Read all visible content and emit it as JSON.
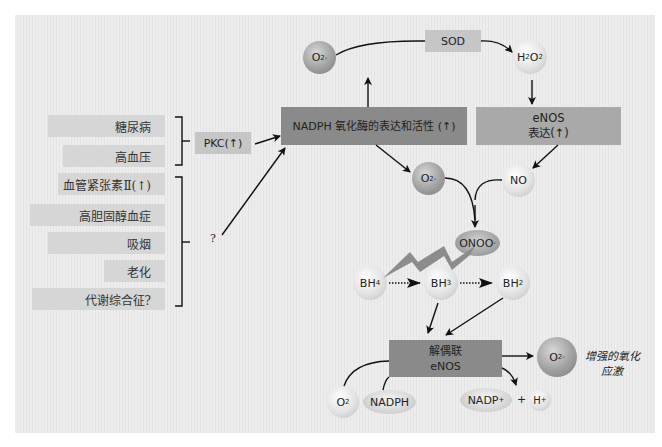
{
  "colors": {
    "panel_bg": "#e9e9e9",
    "label_bg": "#d6d6d6",
    "nadph_box": "#8a8a8a",
    "enos_box": "#a9a9a9",
    "sod_box": "#c6c6c6",
    "arrow": "#111111"
  },
  "risk_factors": {
    "group_pkc": [
      "糖尿病",
      "高血压"
    ],
    "group_unknown": [
      "血管紧张素Ⅱ(↑)",
      "高胆固醇血症",
      "吸烟",
      "老化",
      "代谢综合征?"
    ]
  },
  "pkc": {
    "label": "PKC(↑)"
  },
  "unknown_mediator": {
    "label": "?"
  },
  "nadph_oxidase": {
    "label": "NADPH 氧化酶的表达和活性 (↑)"
  },
  "sod": {
    "label": "SOD"
  },
  "enos_expression": {
    "line1": "eNOS",
    "line2": "表达(↑)"
  },
  "molecules": {
    "superoxide_top": {
      "base": "O",
      "sub": "2",
      "sup": "-"
    },
    "h2o2": {
      "h": "H",
      "s1": "2",
      "o": "O",
      "s2": "2"
    },
    "superoxide_mid": {
      "base": "O",
      "sub": "2",
      "sup": "-"
    },
    "no": "NO",
    "onoo": {
      "base": "ONOO",
      "sup": "-"
    },
    "bh4": {
      "base": "BH",
      "sub": "4"
    },
    "bh3": {
      "base": "BH",
      "sub": "3"
    },
    "bh2": {
      "base": "BH",
      "sub": "2"
    },
    "o2": {
      "base": "O",
      "sub": "2"
    },
    "nadph": "NADPH",
    "nadp_plus": {
      "base": "NADP",
      "sup": "+"
    },
    "plus_sign": "+",
    "h_plus": {
      "base": "H",
      "sup": "+"
    },
    "superoxide_out": {
      "base": "O",
      "sub": "2",
      "sup": "-"
    }
  },
  "uncoupled_enos": {
    "line1": "解偶联",
    "line2": "eNOS"
  },
  "outcome": {
    "line1": "增强的氧化",
    "line2": "应激"
  }
}
